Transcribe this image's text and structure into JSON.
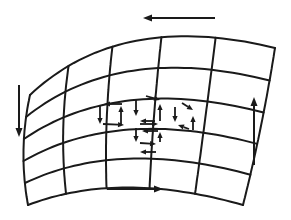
{
  "diagram": {
    "type": "curved-surface-grid-with-circulation-arrows",
    "background": "#ffffff",
    "stroke_color": "#1a1a1a",
    "grid": {
      "columns": 5,
      "rows": 5,
      "corners": {
        "top_left": [
          30,
          95
        ],
        "top_right": [
          275,
          48
        ],
        "bottom_left": [
          28,
          205
        ],
        "bottom_right": [
          243,
          205
        ]
      },
      "top_edge_ctrl": [
        120,
        10
      ],
      "bottom_edge_ctrl": [
        120,
        170
      ],
      "left_edge_ctrl": [
        18,
        150
      ],
      "right_edge_ctrl": [
        262,
        130
      ]
    },
    "outer_arrows": [
      {
        "name": "top-arrow-left",
        "from": [
          215,
          18
        ],
        "to": [
          143,
          18
        ],
        "direction": "left"
      },
      {
        "name": "bottom-arrow-right",
        "from": [
          107,
          189
        ],
        "to": [
          163,
          189
        ],
        "direction": "right"
      },
      {
        "name": "left-arrow-down",
        "from": [
          19,
          85
        ],
        "to": [
          19,
          137
        ],
        "direction": "down"
      },
      {
        "name": "right-arrow-up",
        "from": [
          254,
          165
        ],
        "to": [
          254,
          97
        ],
        "direction": "up"
      }
    ],
    "inner_arrows": [
      {
        "from": [
          122,
          104
        ],
        "to": [
          104,
          104
        ]
      },
      {
        "from": [
          100,
          106
        ],
        "to": [
          100,
          124
        ]
      },
      {
        "from": [
          103,
          124
        ],
        "to": [
          124,
          125
        ]
      },
      {
        "from": [
          121,
          124
        ],
        "to": [
          121,
          106
        ]
      },
      {
        "from": [
          136,
          100
        ],
        "to": [
          136,
          116
        ]
      },
      {
        "from": [
          146,
          96
        ],
        "to": [
          160,
          100
        ]
      },
      {
        "from": [
          160,
          121
        ],
        "to": [
          160,
          104
        ]
      },
      {
        "from": [
          155,
          121
        ],
        "to": [
          140,
          121
        ]
      },
      {
        "from": [
          175,
          107
        ],
        "to": [
          175,
          122
        ]
      },
      {
        "from": [
          182,
          103
        ],
        "to": [
          193,
          110
        ]
      },
      {
        "from": [
          193,
          130
        ],
        "to": [
          193,
          116
        ]
      },
      {
        "from": [
          189,
          129
        ],
        "to": [
          178,
          125
        ]
      },
      {
        "from": [
          140,
          124
        ],
        "to": [
          158,
          124
        ]
      },
      {
        "from": [
          158,
          131
        ],
        "to": [
          142,
          131
        ]
      },
      {
        "from": [
          136,
          128
        ],
        "to": [
          136,
          142
        ]
      },
      {
        "from": [
          160,
          142
        ],
        "to": [
          160,
          132
        ]
      },
      {
        "from": [
          140,
          143
        ],
        "to": [
          156,
          144
        ]
      },
      {
        "from": [
          156,
          152
        ],
        "to": [
          140,
          152
        ]
      }
    ]
  }
}
